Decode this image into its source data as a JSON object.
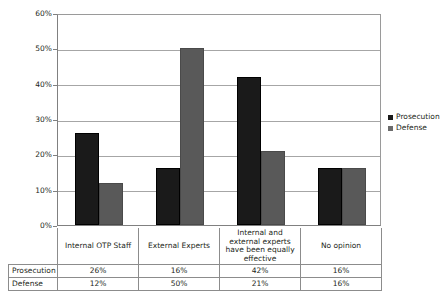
{
  "chart_data": {
    "type": "bar",
    "title": "",
    "xlabel": "",
    "ylabel": "",
    "ylim": [
      0,
      60
    ],
    "ytick_labels": [
      "0%",
      "10%",
      "20%",
      "30%",
      "40%",
      "50%",
      "60%"
    ],
    "ytick_values": [
      0,
      10,
      20,
      30,
      40,
      50,
      60
    ],
    "grid": true,
    "legend_position": "right",
    "categories": [
      "Internal OTP Staff",
      "External Experts",
      "Internal and external experts have been equally effective",
      "No opinion"
    ],
    "series": [
      {
        "name": "Prosecution",
        "values": [
          26,
          16,
          42,
          16
        ],
        "color": "#1a1a1a",
        "labels": [
          "26%",
          "16%",
          "42%",
          "16%"
        ]
      },
      {
        "name": "Defense",
        "values": [
          12,
          50,
          21,
          16
        ],
        "color": "#595959",
        "labels": [
          "12%",
          "50%",
          "21%",
          "16%"
        ]
      }
    ]
  },
  "legend": {
    "items": [
      {
        "label": "Prosecution"
      },
      {
        "label": "Defense"
      }
    ]
  },
  "table": {
    "row_labels": [
      "Prosecution",
      "Defense"
    ],
    "column_headers": [
      "Internal OTP Staff",
      "External Experts",
      "Internal and external experts have been equally effective",
      "No opinion"
    ],
    "rows": [
      {
        "label": "Prosecution",
        "cells": [
          "26%",
          "16%",
          "42%",
          "16%"
        ]
      },
      {
        "label": "Defense",
        "cells": [
          "12%",
          "50%",
          "21%",
          "16%"
        ]
      }
    ]
  }
}
